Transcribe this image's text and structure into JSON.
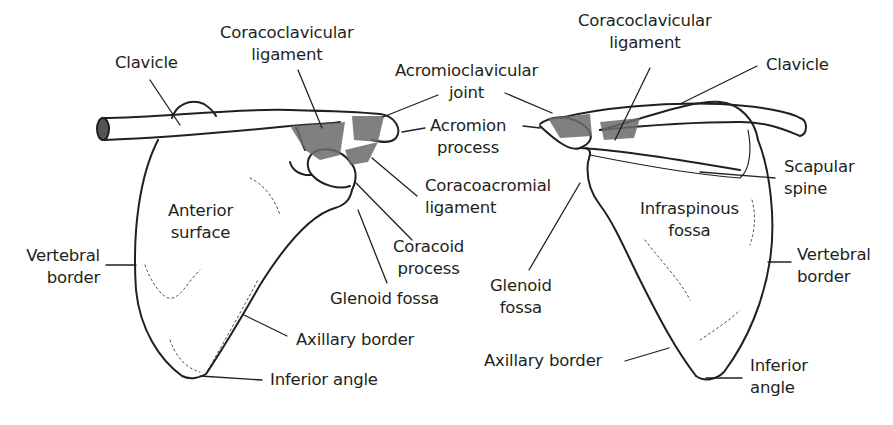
{
  "diagram": {
    "colors": {
      "ink": "#231f20",
      "ligament": "#6b6b6b",
      "background": "#ffffff"
    },
    "anterior_view": {
      "labels": {
        "clavicle": "Clavicle",
        "coracoclavicular_1": "Coracoclavicular",
        "coracoclavicular_2": "ligament",
        "acromioclavicular_1": "Acromioclavicular",
        "acromioclavicular_2": "joint",
        "acromion_1": "Acromion",
        "acromion_2": "process",
        "coracoacromial_1": "Coracoacromial",
        "coracoacromial_2": "ligament",
        "coracoid_1": "Coracoid",
        "coracoid_2": "process",
        "glenoid": "Glenoid fossa",
        "anterior_1": "Anterior",
        "anterior_2": "surface",
        "vertebral_1": "Vertebral",
        "vertebral_2": "border",
        "axillary": "Axillary border",
        "inferior": "Inferior angle"
      }
    },
    "posterior_view": {
      "labels": {
        "coracoclavicular_1": "Coracoclavicular",
        "coracoclavicular_2": "ligament",
        "clavicle": "Clavicle",
        "scapular_spine_1": "Scapular",
        "scapular_spine_2": "spine",
        "infraspinous_1": "Infraspinous",
        "infraspinous_2": "fossa",
        "vertebral_1": "Vertebral",
        "vertebral_2": "border",
        "glenoid_1": "Glenoid",
        "glenoid_2": "fossa",
        "axillary": "Axillary border",
        "inferior_1": "Inferior",
        "inferior_2": "angle"
      }
    }
  }
}
